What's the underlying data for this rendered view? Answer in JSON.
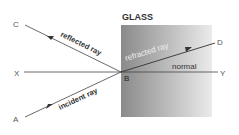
{
  "diagram": {
    "medium_label": "GLASS",
    "points": {
      "A": "A",
      "B": "B",
      "C": "C",
      "D": "D",
      "X": "X",
      "Y": "Y"
    },
    "rays": {
      "incident": "incident ray",
      "reflected": "reflected ray",
      "refracted": "refracted ray",
      "normal": "normal"
    },
    "colors": {
      "glass_dark": "#8a8a8a",
      "glass_light": "#e6e6e6",
      "line": "#444444"
    }
  }
}
